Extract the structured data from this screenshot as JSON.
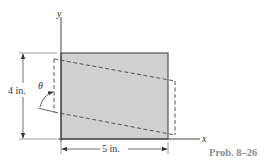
{
  "figure": {
    "caption": "Prob. 8–26",
    "axes": {
      "x_label": "x",
      "y_label": "y"
    },
    "dimensions": {
      "height_label": "4 in.",
      "width_label": "5 in."
    },
    "angle_label": "θ",
    "shapes": {
      "rectangle": {
        "description": "undeformed plate",
        "fill": "#d0d0d0",
        "stroke": "#555555"
      },
      "deformed": {
        "description": "deformed shape (dashed parallelogram)",
        "stroke": "#444444"
      }
    }
  }
}
